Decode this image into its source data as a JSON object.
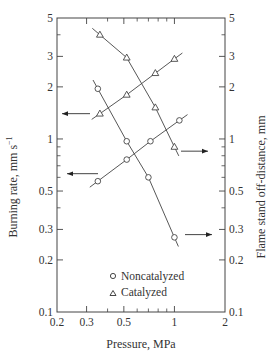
{
  "chart_data": {
    "type": "scatter",
    "title": "",
    "xlabel": "Pressure,  MPa",
    "ylabel": "Burning  rate,  mm s⁻¹",
    "ylabel_right": "Flame  stand  off-distance,  mm",
    "xscale": "log",
    "yscale": "log",
    "xlim": [
      0.2,
      2
    ],
    "ylim": [
      0.1,
      5
    ],
    "ylim_right": [
      0.1,
      5
    ],
    "x_ticks": [
      {
        "value": 0.2,
        "label": "0.2"
      },
      {
        "value": 0.3,
        "label": "0.3"
      },
      {
        "value": 0.5,
        "label": "0.5"
      },
      {
        "value": 1,
        "label": "1"
      },
      {
        "value": 2,
        "label": "2"
      }
    ],
    "x_minor_ticks": [
      0.4,
      0.6,
      0.7,
      0.8,
      0.9
    ],
    "y_ticks": [
      {
        "value": 0.1,
        "label": "0.1"
      },
      {
        "value": 0.2,
        "label": "0.2"
      },
      {
        "value": 0.3,
        "label": "0.3"
      },
      {
        "value": 0.5,
        "label": "0.5"
      },
      {
        "value": 1,
        "label": "1"
      },
      {
        "value": 2,
        "label": "2"
      },
      {
        "value": 3,
        "label": "3"
      },
      {
        "value": 5,
        "label": "5"
      }
    ],
    "y_minor_ticks": [
      0.4,
      0.6,
      0.7,
      0.8,
      0.9,
      4
    ],
    "grid": false,
    "legend": {
      "position": "lower center inside",
      "entries": [
        {
          "marker": "circle",
          "label": "Noncatalyzed"
        },
        {
          "marker": "triangle",
          "label": "Catalyzed"
        }
      ]
    },
    "series": [
      {
        "name": "Noncatalyzed burning rate",
        "marker": "circle",
        "axis": "left",
        "x": [
          0.35,
          0.52,
          0.7,
          1.0
        ],
        "y": [
          1.95,
          0.97,
          0.6,
          0.27
        ]
      },
      {
        "name": "Noncatalyzed flame stand-off distance",
        "marker": "circle",
        "axis": "right",
        "x": [
          0.35,
          0.52,
          0.72,
          1.07
        ],
        "y": [
          0.57,
          0.76,
          0.97,
          1.28
        ]
      },
      {
        "name": "Catalyzed burning rate",
        "marker": "triangle",
        "axis": "left",
        "x": [
          0.36,
          0.52,
          0.77,
          1.0
        ],
        "y": [
          1.4,
          1.8,
          2.4,
          2.9
        ]
      },
      {
        "name": "Catalyzed flame stand-off distance",
        "marker": "triangle",
        "axis": "right",
        "x": [
          0.36,
          0.52,
          0.77,
          1.0
        ],
        "y": [
          4.0,
          2.95,
          1.52,
          0.9
        ]
      }
    ],
    "annotations": [
      {
        "type": "arrow",
        "direction": "left",
        "points_to": "left axis",
        "series": "Catalyzed burning rate",
        "y": 1.4
      },
      {
        "type": "arrow",
        "direction": "left",
        "points_to": "left axis",
        "series": "Noncatalyzed burning rate",
        "y": 0.63
      },
      {
        "type": "arrow",
        "direction": "right",
        "points_to": "right axis",
        "series": "Catalyzed flame stand-off distance",
        "y": 0.85
      },
      {
        "type": "arrow",
        "direction": "right",
        "points_to": "right axis",
        "series": "Noncatalyzed flame stand-off distance",
        "y": 0.28
      }
    ]
  },
  "labels": {
    "xlabel": "Pressure,  MPa",
    "ylabel": "Burning  rate,  mm s",
    "ylabel_sup": "−1",
    "ylabel_right": "Flame  stand  off-distance,  mm",
    "legend_noncat": "Noncatalyzed",
    "legend_cat": "Catalyzed"
  }
}
